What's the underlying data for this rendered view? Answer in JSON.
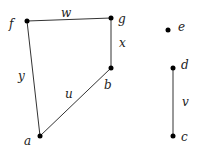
{
  "graph": {
    "nodes": [
      {
        "id": "f",
        "label": "f",
        "x": 27,
        "y": 21,
        "lx": 9,
        "ly": 28
      },
      {
        "id": "g",
        "label": "g",
        "x": 111,
        "y": 18,
        "lx": 118,
        "ly": 23
      },
      {
        "id": "b",
        "label": "b",
        "x": 111,
        "y": 68,
        "lx": 104,
        "ly": 89
      },
      {
        "id": "a",
        "label": "a",
        "x": 40,
        "y": 136,
        "lx": 24,
        "ly": 145
      },
      {
        "id": "e",
        "label": "e",
        "x": 168,
        "y": 30,
        "lx": 178,
        "ly": 31
      },
      {
        "id": "d",
        "label": "d",
        "x": 173,
        "y": 68,
        "lx": 181,
        "ly": 69
      },
      {
        "id": "c",
        "label": "c",
        "x": 173,
        "y": 136,
        "lx": 181,
        "ly": 141
      }
    ],
    "edges": [
      {
        "from": "f",
        "to": "g",
        "label": "w",
        "lx": 61,
        "ly": 17
      },
      {
        "from": "g",
        "to": "b",
        "label": "x",
        "lx": 119,
        "ly": 47
      },
      {
        "from": "f",
        "to": "a",
        "label": "y",
        "lx": 18,
        "ly": 80
      },
      {
        "from": "a",
        "to": "b",
        "label": "u",
        "lx": 65,
        "ly": 98
      },
      {
        "from": "d",
        "to": "c",
        "label": "v",
        "lx": 182,
        "ly": 106
      }
    ]
  }
}
